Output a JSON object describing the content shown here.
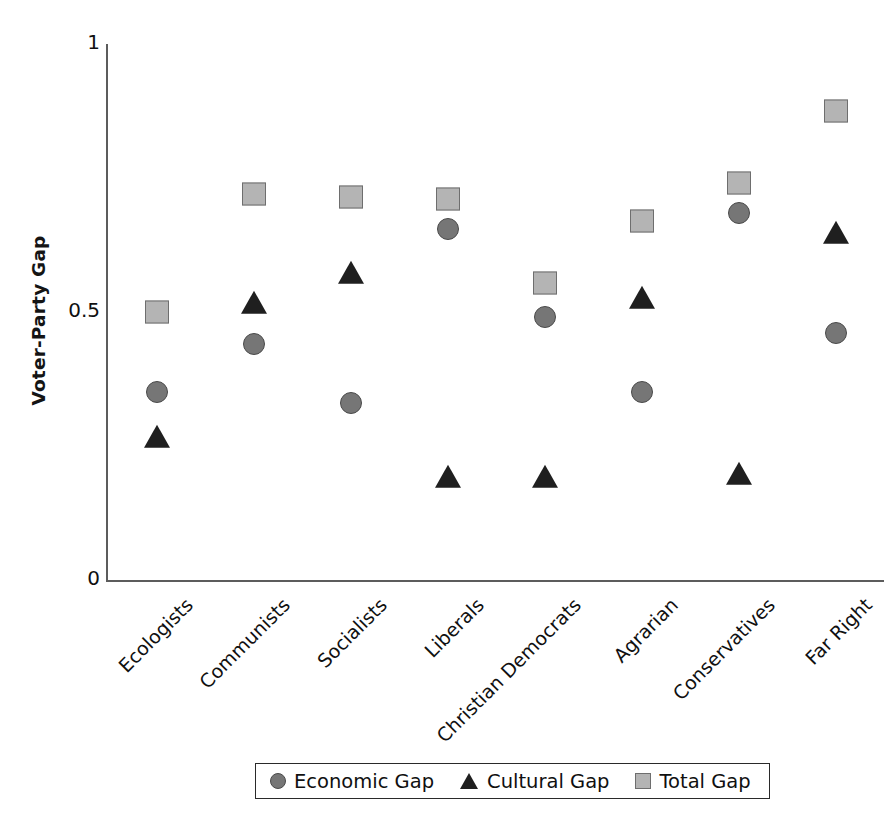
{
  "chart_data": {
    "type": "scatter",
    "title": "",
    "xlabel": "",
    "ylabel": "Voter-Party Gap",
    "ylim": [
      0,
      1
    ],
    "ytick_values": [
      0,
      0.5,
      1
    ],
    "ytick_labels": [
      "0",
      "0.5",
      "1"
    ],
    "grid": false,
    "legend_position": "bottom",
    "categories": [
      "Ecologists",
      "Communists",
      "Socialists",
      "Liberals",
      "Christian Democrats",
      "Agrarian",
      "Conservatives",
      "Far Right"
    ],
    "series": [
      {
        "name": "Economic Gap",
        "marker": "circle",
        "color": "#767676",
        "values": [
          0.35,
          0.44,
          0.33,
          0.655,
          0.49,
          0.35,
          0.685,
          0.46
        ]
      },
      {
        "name": "Cultural Gap",
        "marker": "triangle",
        "color": "#1f1f1f",
        "values": [
          0.265,
          0.515,
          0.57,
          0.19,
          0.19,
          0.525,
          0.195,
          0.645
        ]
      },
      {
        "name": "Total Gap",
        "marker": "square",
        "color": "#b4b4b4",
        "values": [
          0.5,
          0.72,
          0.715,
          0.71,
          0.555,
          0.67,
          0.74,
          0.875
        ]
      }
    ]
  },
  "legend": {
    "entries": [
      {
        "label": "Economic Gap",
        "marker": "circle"
      },
      {
        "label": "Cultural Gap",
        "marker": "triangle"
      },
      {
        "label": "Total Gap",
        "marker": "square"
      }
    ]
  }
}
